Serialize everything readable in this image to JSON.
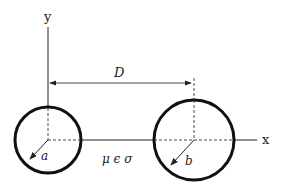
{
  "diagram": {
    "axes": {
      "x_label": "x",
      "y_label": "y"
    },
    "distance_label": "D",
    "left_conductor": {
      "radius_label": "a"
    },
    "right_conductor": {
      "radius_label": "b"
    },
    "medium_label": "μ ϵ σ",
    "colors": {
      "stroke": "#1a1a1a",
      "background": "#ffffff"
    }
  }
}
